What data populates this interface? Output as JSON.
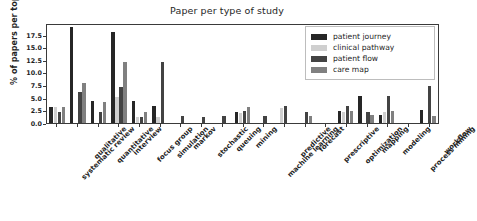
{
  "chart_data": {
    "type": "bar",
    "title": "Paper per type of study",
    "xlabel": "",
    "ylabel": "% of papers per topic",
    "ylim": [
      0,
      19.8
    ],
    "yticks": [
      "0.0",
      "2.5",
      "5.0",
      "7.5",
      "10.0",
      "12.5",
      "15.0",
      "17.5"
    ],
    "ytick_values": [
      0.0,
      2.5,
      5.0,
      7.5,
      10.0,
      12.5,
      15.0,
      17.5
    ],
    "grid": false,
    "legend_position": "upper right",
    "categories": [
      "systematic review",
      "qualitative",
      "quantitative",
      "interview",
      "focus group",
      "simulation",
      "markov",
      "stochastic",
      "queuing",
      "mining",
      "machine learning",
      "predictive",
      "forecast",
      "prescriptive",
      "optimization",
      "mapping",
      "modeling",
      "process mining",
      "workflow"
    ],
    "series": [
      {
        "name": "patient journey",
        "color": "#262626",
        "values": [
          3.2,
          19.0,
          4.3,
          18.0,
          4.3,
          3.3,
          0.0,
          0.0,
          0.0,
          2.2,
          0.0,
          0.0,
          0.0,
          0.0,
          2.4,
          5.3,
          1.6,
          0.0,
          2.5
        ]
      },
      {
        "name": "clinical pathway",
        "color": "#cfcfcf",
        "values": [
          3.2,
          0.0,
          0.0,
          5.1,
          1.1,
          1.2,
          0.0,
          0.0,
          0.0,
          1.9,
          0.0,
          2.9,
          0.0,
          0.0,
          2.2,
          0.0,
          2.1,
          0.0,
          0.0
        ]
      },
      {
        "name": "patient flow",
        "color": "#434343",
        "values": [
          2.1,
          6.1,
          2.1,
          7.1,
          1.1,
          12.1,
          1.3,
          1.2,
          1.3,
          2.3,
          1.3,
          3.3,
          2.2,
          0.0,
          3.3,
          2.2,
          5.3,
          0.0,
          7.3
        ]
      },
      {
        "name": "care map",
        "color": "#808080",
        "values": [
          3.2,
          8.0,
          4.2,
          12.1,
          2.2,
          0.0,
          0.0,
          0.0,
          0.0,
          3.2,
          0.0,
          0.0,
          1.4,
          0.0,
          2.4,
          1.5,
          2.3,
          0.0,
          1.4
        ]
      }
    ]
  },
  "legend": {
    "entries": [
      {
        "label": "patient journey"
      },
      {
        "label": "clinical pathway"
      },
      {
        "label": "patient flow"
      },
      {
        "label": "care map"
      }
    ]
  }
}
